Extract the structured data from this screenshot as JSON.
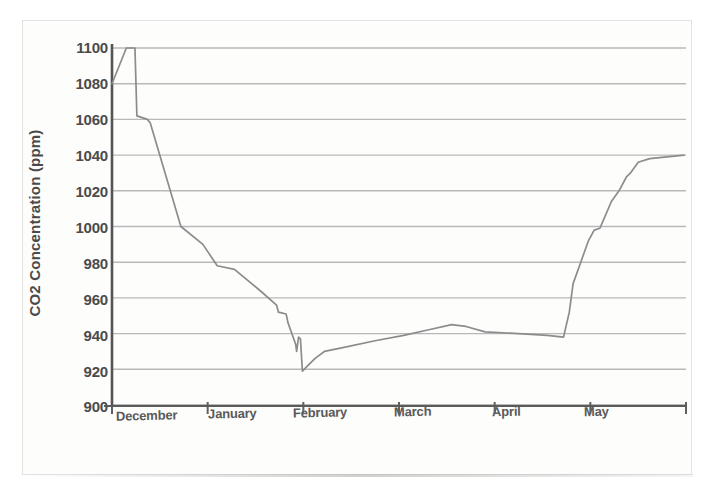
{
  "chart_data": {
    "type": "line",
    "title": "",
    "xlabel": "",
    "ylabel": "CO2 Concentration (ppm)",
    "ylim": [
      900,
      1100
    ],
    "ytick_values": [
      1100,
      1080,
      1060,
      1040,
      1020,
      1000,
      980,
      960,
      940,
      920,
      900
    ],
    "ytick_labels": [
      "1100",
      "1080",
      "1060",
      "1040",
      "1020",
      "1000",
      "980",
      "960",
      "940",
      "920",
      "900"
    ],
    "yaxis_step": 20,
    "grid": true,
    "grid_axis": "y",
    "legend": "none",
    "xtick_labels": [
      "December",
      "January",
      "February",
      "March",
      "April",
      "May"
    ],
    "xlim_months": [
      0,
      6
    ],
    "series": [
      {
        "name": "CO2 concentration",
        "color": "#8c8c8c",
        "points": [
          {
            "x": 0.0,
            "y": 1080
          },
          {
            "x": 0.15,
            "y": 1100
          },
          {
            "x": 0.24,
            "y": 1100
          },
          {
            "x": 0.26,
            "y": 1062
          },
          {
            "x": 0.37,
            "y": 1060
          },
          {
            "x": 0.4,
            "y": 1058
          },
          {
            "x": 0.72,
            "y": 1000
          },
          {
            "x": 0.95,
            "y": 990
          },
          {
            "x": 1.1,
            "y": 978
          },
          {
            "x": 1.28,
            "y": 976
          },
          {
            "x": 1.55,
            "y": 964
          },
          {
            "x": 1.72,
            "y": 956
          },
          {
            "x": 1.74,
            "y": 952
          },
          {
            "x": 1.82,
            "y": 951
          },
          {
            "x": 1.84,
            "y": 946
          },
          {
            "x": 1.92,
            "y": 934
          },
          {
            "x": 1.93,
            "y": 930
          },
          {
            "x": 1.95,
            "y": 938
          },
          {
            "x": 1.97,
            "y": 937
          },
          {
            "x": 1.99,
            "y": 919
          },
          {
            "x": 2.12,
            "y": 926
          },
          {
            "x": 2.22,
            "y": 930
          },
          {
            "x": 2.4,
            "y": 932
          },
          {
            "x": 2.75,
            "y": 936
          },
          {
            "x": 3.05,
            "y": 939
          },
          {
            "x": 3.3,
            "y": 942
          },
          {
            "x": 3.55,
            "y": 945
          },
          {
            "x": 3.7,
            "y": 944
          },
          {
            "x": 3.9,
            "y": 941
          },
          {
            "x": 4.25,
            "y": 940
          },
          {
            "x": 4.55,
            "y": 939
          },
          {
            "x": 4.72,
            "y": 938
          },
          {
            "x": 4.78,
            "y": 952
          },
          {
            "x": 4.82,
            "y": 968
          },
          {
            "x": 4.9,
            "y": 980
          },
          {
            "x": 4.98,
            "y": 992
          },
          {
            "x": 5.04,
            "y": 998
          },
          {
            "x": 5.1,
            "y": 999
          },
          {
            "x": 5.14,
            "y": 1004
          },
          {
            "x": 5.22,
            "y": 1014
          },
          {
            "x": 5.3,
            "y": 1020
          },
          {
            "x": 5.38,
            "y": 1028
          },
          {
            "x": 5.42,
            "y": 1030
          },
          {
            "x": 5.5,
            "y": 1036
          },
          {
            "x": 5.62,
            "y": 1038
          },
          {
            "x": 5.98,
            "y": 1040
          }
        ]
      }
    ],
    "annotations": [],
    "colors": {
      "line": "#8c8c8c",
      "grid": "#b9b9b9",
      "axis": "#555555",
      "text": "#4b4b4b",
      "background": "#fdfdfc",
      "page_border": "#e2e2e0"
    }
  }
}
